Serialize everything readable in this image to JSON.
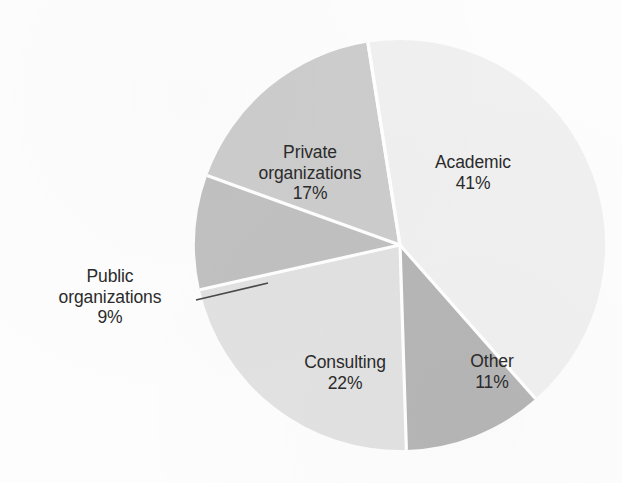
{
  "chart_data": {
    "type": "pie",
    "title": "",
    "subtitle": "",
    "xlabel": "",
    "ylabel": "",
    "legend_position": "none",
    "grid": false,
    "labels_inside_slices": true,
    "total_percent": 100,
    "categories": [
      "Academic",
      "Other",
      "Consulting",
      "Public organizations",
      "Private organizations"
    ],
    "values": [
      41,
      11,
      22,
      9,
      17
    ],
    "slices": [
      {
        "name": "Academic",
        "label": "Academic",
        "value": 41,
        "value_text": "41%",
        "color": "#f0f0f0",
        "label_placement": "inside"
      },
      {
        "name": "Other",
        "label": "Other",
        "value": 11,
        "value_text": "11%",
        "color": "#b6b6b6",
        "label_placement": "inside"
      },
      {
        "name": "Consulting",
        "label": "Consulting",
        "value": 22,
        "value_text": "22%",
        "color": "#e2e2e2",
        "label_placement": "inside"
      },
      {
        "name": "Public organizations",
        "label_line1": "Public",
        "label_line2": "organizations",
        "value": 9,
        "value_text": "9%",
        "color": "#c1c1c1",
        "label_placement": "outside-with-leader-line"
      },
      {
        "name": "Private organizations",
        "label_line1": "Private",
        "label_line2": "organizations",
        "value": 17,
        "value_text": "17%",
        "color": "#cdcdcd",
        "label_placement": "inside"
      }
    ],
    "colors": {
      "academic": "#f0f0f0",
      "other": "#b6b6b6",
      "consulting": "#e2e2e2",
      "public_organizations": "#c1c1c1",
      "private_organizations": "#cdcdcd",
      "background": "#fdfdfd",
      "label_text": "#2b2b2b",
      "slice_separator": "#ffffff",
      "leader_line": "#4a4a4a"
    }
  }
}
